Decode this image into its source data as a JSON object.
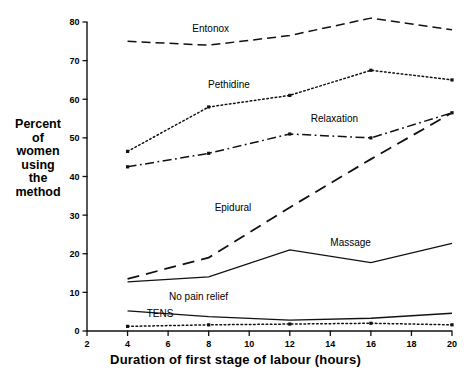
{
  "chart_data": {
    "type": "line",
    "title": "",
    "xlabel": "Duration of first stage of labour (hours)",
    "ylabel": "Percent of women using the method",
    "ylabel_lines": [
      "Percent",
      "of",
      "women",
      "using",
      "the",
      "method"
    ],
    "x": [
      4,
      8,
      12,
      16,
      20
    ],
    "xlim": [
      2,
      20
    ],
    "ylim": [
      0,
      80
    ],
    "xticks": [
      2,
      4,
      6,
      8,
      10,
      12,
      14,
      16,
      18,
      20
    ],
    "xticklabels": [
      "2",
      "4",
      "6",
      "8",
      "10",
      "12",
      "14",
      "16",
      "18",
      "20"
    ],
    "yticks": [
      0,
      10,
      20,
      30,
      40,
      50,
      60,
      70,
      80
    ],
    "yticklabels": [
      "0",
      "10",
      "20",
      "30",
      "40",
      "50",
      "60",
      "70",
      "80"
    ],
    "grid": false,
    "legend_position": "inline-annotations",
    "series": [
      {
        "name": "Entonox",
        "style": "dashed",
        "values": [
          75.0,
          74.0,
          76.5,
          81.0,
          78.0
        ],
        "label_x": 8.1,
        "label_y": 77.5
      },
      {
        "name": "Pethidine",
        "style": "dotted",
        "values": [
          46.5,
          58.0,
          61.0,
          67.5,
          65.0
        ],
        "label_x": 9.0,
        "label_y": 63.0
      },
      {
        "name": "Relaxation",
        "style": "dash-dot",
        "values": [
          42.5,
          46.0,
          51.0,
          50.0,
          56.5
        ],
        "label_x": 14.2,
        "label_y": 54.0
      },
      {
        "name": "Epidural",
        "style": "long-dash",
        "values": [
          13.5,
          19.0,
          32.0,
          44.5,
          56.5
        ],
        "label_x": 9.2,
        "label_y": 31.0
      },
      {
        "name": "Massage",
        "style": "solid",
        "values": [
          12.7,
          14.0,
          21.0,
          17.7,
          22.7
        ],
        "label_x": 15.0,
        "label_y": 22.0
      },
      {
        "name": "No pain relief",
        "style": "solid",
        "values": [
          5.2,
          3.7,
          2.8,
          3.3,
          4.6
        ],
        "label_x": 7.5,
        "label_y": 8.0
      },
      {
        "name": "TENS",
        "style": "dotted",
        "values": [
          1.2,
          1.6,
          1.8,
          2.0,
          1.6
        ],
        "label_x": 5.6,
        "label_y": 3.6
      }
    ]
  }
}
